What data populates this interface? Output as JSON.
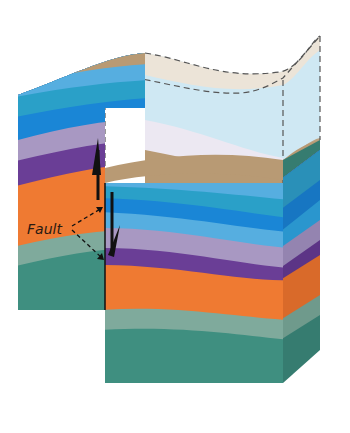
{
  "labels": {
    "fault": "Fault"
  },
  "colors": {
    "tan": "#b89a74",
    "pale_blue": "#a9d4e8",
    "sky_blue": "#56aee0",
    "teal_blue": "#2aa0c8",
    "blue": "#1a86d6",
    "lavender": "#a898c2",
    "purple": "#6a3e96",
    "orange": "#ef7a32",
    "sage": "#7faa9c",
    "green": "#3f8f80",
    "ghost_top": "#ece4d8",
    "ghost_blue": "#cfe8f3",
    "arrow": "#111111"
  },
  "diagram": {
    "elements": [
      "left-block-footwall",
      "right-block-hangingwall",
      "ghost-upper-block",
      "fault-plane",
      "motion-arrows",
      "fault-label"
    ]
  }
}
